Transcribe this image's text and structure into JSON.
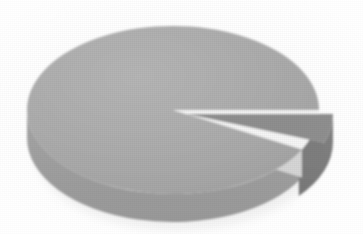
{
  "chart_data": {
    "type": "pie",
    "title": "",
    "subtitle": "",
    "xlabel": "",
    "ylabel": "",
    "grid": false,
    "legend_position": "none",
    "three_d": true,
    "labels_visible": false,
    "categories": [
      "Slice 1",
      "Slice 2",
      "Slice 3"
    ],
    "values": [
      87,
      8,
      5
    ],
    "unit": "%",
    "series": [
      {
        "name": "Distribution",
        "values": [
          87,
          8,
          5
        ]
      }
    ],
    "slices": [
      {
        "label": "Slice 1",
        "value": 87,
        "percent": "87%",
        "color": "#ABABAB",
        "side_color": "#9E9E9E",
        "start_angle_deg": 28,
        "end_angle_deg": 360,
        "exploded": false
      },
      {
        "label": "Slice 2",
        "value": 8,
        "percent": "8%",
        "color": "#F6F6F6",
        "side_color": "#D6D6D6",
        "start_angle_deg": 0,
        "end_angle_deg": 28,
        "exploded": false
      },
      {
        "label": "Slice 3",
        "value": 5,
        "percent": "5%",
        "color": "#8F8F8F",
        "side_color": "#7E7E7E",
        "start_angle_deg": 340,
        "end_angle_deg": 360,
        "exploded": true
      }
    ],
    "colors": {
      "background": "#FFFFFF",
      "main_slice": "#ABABAB",
      "main_slice_side": "#9E9E9E",
      "white_slice": "#F6F6F6",
      "white_slice_side": "#D6D6D6",
      "dark_slice": "#8F8F8F",
      "dark_slice_side": "#7E7E7E",
      "shadow": "#E3E3E3"
    },
    "geometry": {
      "center_x": 173,
      "center_y": 110,
      "radius_x": 146,
      "radius_y": 84,
      "depth_px": 28,
      "explode_offset_x": 14,
      "explode_offset_y": 4
    }
  }
}
